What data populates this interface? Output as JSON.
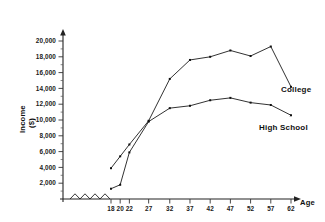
{
  "chart_data": {
    "type": "line",
    "title": "",
    "xlabel": "Age",
    "ylabel": "Income ($)",
    "xlim": [
      16,
      64
    ],
    "ylim": [
      0,
      21000
    ],
    "grid": false,
    "legend_position": "inline-right",
    "axis_break_x": true,
    "x_ticks": [
      18,
      20,
      22,
      27,
      32,
      37,
      42,
      47,
      52,
      57,
      62
    ],
    "x_tick_labels": [
      "18",
      "20",
      "22",
      "27",
      "32",
      "37",
      "42",
      "47",
      "52",
      "57",
      "62"
    ],
    "y_ticks": [
      2000,
      4000,
      6000,
      8000,
      10000,
      12000,
      14000,
      16000,
      18000,
      20000
    ],
    "y_tick_labels": [
      "2,000",
      "4,000",
      "6,000",
      "8,000",
      "10,000",
      "12,000",
      "14,000",
      "16,000",
      "18,000",
      "20,000"
    ],
    "x": [
      18,
      20,
      22,
      27,
      32,
      37,
      42,
      47,
      52,
      57,
      62
    ],
    "series": [
      {
        "name": "College",
        "label": "College",
        "values": [
          3900,
          5400,
          6900,
          9900,
          15200,
          17600,
          18000,
          18800,
          18100,
          19300,
          14200
        ]
      },
      {
        "name": "High School",
        "label": "High School",
        "values": [
          1300,
          1800,
          5900,
          9800,
          11500,
          11800,
          12500,
          12800,
          12200,
          11900,
          10600
        ]
      }
    ]
  },
  "axes": {
    "y_title": "Income",
    "y_unit": "($)",
    "x_title": "Age"
  },
  "labels": {
    "college": "College",
    "high_school": "High School"
  }
}
